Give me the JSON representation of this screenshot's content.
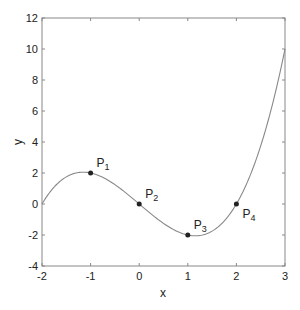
{
  "chart_data": {
    "type": "line",
    "title": "",
    "xlabel": "x",
    "ylabel": "y",
    "xlim": [
      -2,
      3
    ],
    "ylim": [
      -4,
      12
    ],
    "xticks": [
      -2,
      -1,
      0,
      1,
      2,
      3
    ],
    "yticks": [
      -4,
      -2,
      0,
      2,
      4,
      6,
      8,
      10,
      12
    ],
    "grid": false,
    "legend": null,
    "series": [
      {
        "name": "curve",
        "function": "y = (2/3)(x^3 - 4x)",
        "x": [
          -2,
          -1.5,
          -1,
          -0.5,
          0,
          0.5,
          1,
          1.5,
          2,
          2.5,
          3
        ],
        "y": [
          0,
          1.75,
          2,
          1.25,
          0,
          -1.25,
          -2,
          -1.75,
          0,
          3.75,
          10
        ]
      }
    ],
    "points": [
      {
        "label": "P",
        "sub": "1",
        "x": -1,
        "y": 2
      },
      {
        "label": "P",
        "sub": "2",
        "x": 0,
        "y": 0
      },
      {
        "label": "P",
        "sub": "3",
        "x": 1,
        "y": -2
      },
      {
        "label": "P",
        "sub": "4",
        "x": 2,
        "y": 0
      }
    ],
    "colors": {
      "curve": "#888888",
      "points": "#222222",
      "axes": "#888888"
    }
  }
}
